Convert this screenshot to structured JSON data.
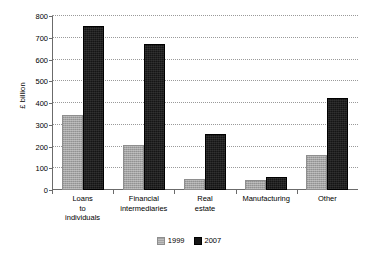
{
  "chart_data": {
    "type": "bar",
    "title": "",
    "xlabel": "",
    "ylabel": "£ billion",
    "ylim": [
      0,
      800
    ],
    "yticks": [
      0,
      100,
      200,
      300,
      400,
      500,
      600,
      700,
      800
    ],
    "ytick_labels": [
      "0",
      "100",
      "200",
      "300",
      "400",
      "500",
      "600",
      "700",
      "800"
    ],
    "grid": true,
    "legend_position": "bottom",
    "categories": [
      "Loans\nto\nindividuals",
      "Financial\nintermediaries",
      "Real\nestate",
      "Manufacturing",
      "Other"
    ],
    "series": [
      {
        "name": "1999",
        "color": "#a3a3a3",
        "values": [
          335,
          198,
          42,
          38,
          153
        ]
      },
      {
        "name": "2007",
        "color": "#151515",
        "values": [
          747,
          663,
          250,
          50,
          412
        ]
      }
    ]
  },
  "legend": {
    "items": [
      {
        "label": "1999",
        "swatch": "legend-swatch-1999"
      },
      {
        "label": "2007",
        "swatch": "legend-swatch-2007"
      }
    ]
  },
  "colors": {
    "series_1999": "#a3a3a3",
    "series_2007": "#151515",
    "axis": "#6b6b6b",
    "gridline": "#9a9a9a",
    "background": "#ffffff",
    "text": "#000000"
  }
}
